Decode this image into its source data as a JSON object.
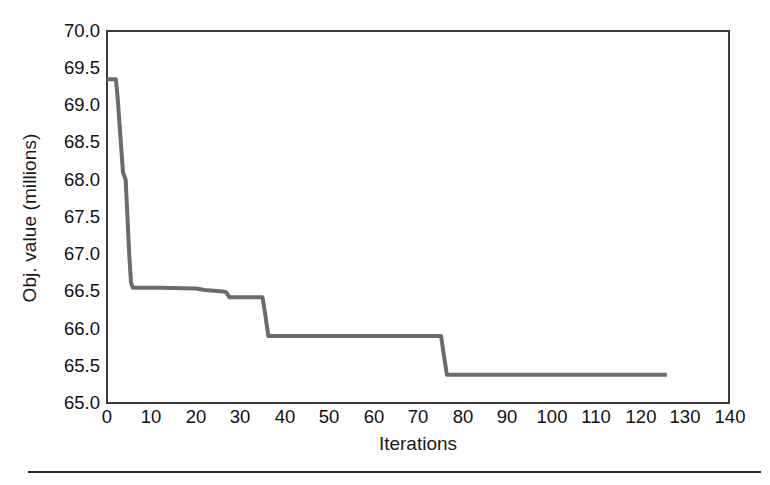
{
  "figure": {
    "background": "#ffffff",
    "bottom_rule_color": "#2b2b2b"
  },
  "axes": {
    "x_title": "Iterations",
    "y_title": "Obj. value (millions)",
    "frame_color": "#3a3a3a",
    "x_tick_labels": [
      "0",
      "10",
      "20",
      "30",
      "40",
      "50",
      "60",
      "70",
      "80",
      "90",
      "100",
      "110",
      "120",
      "130",
      "140"
    ],
    "y_tick_labels": [
      "70.0",
      "69.5",
      "69.0",
      "68.5",
      "68.0",
      "67.5",
      "67.0",
      "66.5",
      "66.0",
      "65.5",
      "65.0"
    ]
  },
  "chart_data": {
    "type": "line",
    "title": "",
    "subtitle": "",
    "xlabel": "Iterations",
    "ylabel": "Obj. value (millions)",
    "xlim": [
      0,
      140
    ],
    "ylim": [
      65.0,
      70.0
    ],
    "xticks": [
      0,
      10,
      20,
      30,
      40,
      50,
      60,
      70,
      80,
      90,
      100,
      110,
      120,
      130,
      140
    ],
    "yticks": [
      65.0,
      65.5,
      66.0,
      66.5,
      67.0,
      67.5,
      68.0,
      68.5,
      69.0,
      69.5,
      70.0
    ],
    "grid": false,
    "legend": null,
    "line_color": "#6b6b6b",
    "line_width": 4,
    "series": [
      {
        "name": "Objective value",
        "x": [
          0,
          1,
          2,
          2.4,
          3.6,
          4.2,
          5.0,
          5.4,
          5.8,
          12,
          20,
          22,
          26,
          26.8,
          27.6,
          35.0,
          35.6,
          36.3,
          50,
          65,
          75.2,
          75.8,
          76.5,
          90,
          110,
          126
        ],
        "y": [
          69.35,
          69.35,
          69.35,
          69.1,
          68.1,
          68.0,
          67.0,
          66.62,
          66.55,
          66.55,
          66.54,
          66.52,
          66.5,
          66.49,
          66.42,
          66.42,
          66.2,
          65.9,
          65.9,
          65.9,
          65.9,
          65.65,
          65.38,
          65.38,
          65.38,
          65.38
        ]
      }
    ],
    "annotations": []
  }
}
